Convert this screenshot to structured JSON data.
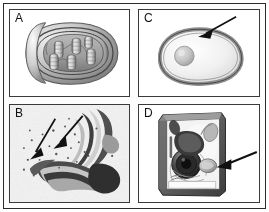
{
  "figure": {
    "layout": "2x2 panel grid",
    "background_color": "#ffffff",
    "frame_color": "#2b2b2b",
    "arrow_color": "#111111"
  },
  "panels": [
    {
      "id": "A",
      "label": "A",
      "position": "top-left",
      "subject": "mitochondrion",
      "style": "shaded 3D cut-away illustration",
      "description": "Bean-shaped organelle cut open to reveal outer membrane, inner membrane and tubular cristae",
      "has_arrow": false,
      "arrows": [],
      "colors": {
        "outer": "#9a9a9a",
        "inner": "#6e6e6e",
        "matrix": "#bdbdbd",
        "cristae": "#d3d3d3"
      }
    },
    {
      "id": "C",
      "label": "C",
      "position": "top-right",
      "subject": "cell with plasma membrane",
      "style": "simple line drawing with gray membrane band",
      "description": "Rounded cell outline with thick gray boundary and a small sphere inside at the left",
      "has_arrow": true,
      "arrows": [
        {
          "name": "membrane-arrow",
          "points_to": "plasma membrane",
          "direction": "down-left"
        }
      ],
      "colors": {
        "membrane": "#8f8f8f",
        "cytoplasm": "#efefef",
        "nucleus": "#c4c4c4"
      }
    },
    {
      "id": "B",
      "label": "B",
      "position": "bottom-left",
      "subject": "golgi apparatus",
      "style": "grayscale electron micrograph",
      "description": "Stacked curved cisternae with surrounding vesicles and speckled cytoplasm",
      "has_arrow": true,
      "arrows": [
        {
          "name": "golgi-arrow-left",
          "points_to": "golgi cisternae",
          "direction": "down-left"
        },
        {
          "name": "golgi-arrow-right",
          "points_to": "golgi cisternae",
          "direction": "down-left"
        }
      ],
      "colors": {
        "background": "#f2f2f2",
        "cisternae_dark": "#3c3c3c",
        "cisternae_light": "#c9c9c9"
      }
    },
    {
      "id": "D",
      "label": "D",
      "position": "bottom-right",
      "subject": "plant cell cut-away",
      "style": "shaded 3D diagram",
      "description": "Rectangular cell block with cell wall, large dark nucleus with nucleolus, and several organelles",
      "has_arrow": true,
      "arrows": [
        {
          "name": "organelle-arrow",
          "points_to": "mitochondrion",
          "direction": "left"
        }
      ],
      "colors": {
        "wall": "#6b6b6b",
        "cytoplasm": "#f4f4f4",
        "nucleus": "#2e2e2e",
        "organelle": "#a9a9a9"
      }
    }
  ]
}
